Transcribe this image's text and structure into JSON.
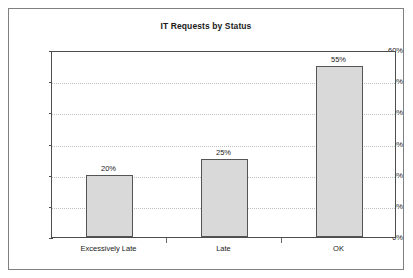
{
  "chart_data": {
    "type": "bar",
    "title": "IT Requests by Status",
    "xlabel": "",
    "ylabel": "",
    "categories": [
      "Excessively Late",
      "Late",
      "OK"
    ],
    "values": [
      20,
      25,
      55
    ],
    "data_labels": [
      "20%",
      "25%",
      "55%"
    ],
    "ylim": [
      0,
      60
    ],
    "ytick_values": [
      0,
      10,
      20,
      30,
      40,
      50,
      60
    ],
    "ytick_labels": [
      "0%",
      "10%",
      "20%",
      "30%",
      "40%",
      "50%",
      "60%"
    ],
    "grid": "horizontal-dotted",
    "legend": "none",
    "colors": {
      "bar_fill": "#d9d9d9",
      "bar_border": "#555555",
      "gridline": "#bfbfbf",
      "axis": "#4d4d4d",
      "frame": "#808080",
      "text": "#1a1a1a",
      "background": "#ffffff"
    }
  }
}
